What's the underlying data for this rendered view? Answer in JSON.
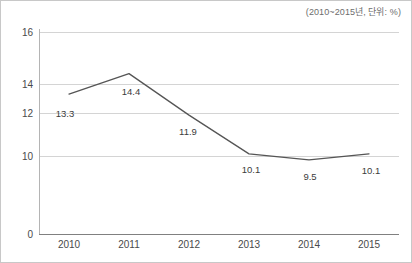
{
  "header": {
    "unit_note": "(2010~2015년, 단위: %)"
  },
  "chart_data": {
    "type": "line",
    "title": "",
    "subtitle": "(2010~2015년, 단위: %)",
    "xlabel": "",
    "ylabel": "",
    "categories": [
      "2010",
      "2011",
      "2012",
      "2013",
      "2014",
      "2015"
    ],
    "values": [
      13.3,
      14.4,
      11.9,
      10.1,
      9.5,
      10.1
    ],
    "value_labels": [
      "13.3",
      "14.4",
      "11.9",
      "10.1",
      "9.5",
      "10.1"
    ],
    "series": [
      {
        "name": "",
        "values": [
          13.3,
          14.4,
          11.9,
          10.1,
          9.5,
          10.1
        ],
        "color": "#555555"
      }
    ],
    "y_ticks": [
      16,
      14,
      12,
      10,
      0
    ],
    "y_tick_labels": [
      "16",
      "14",
      "12",
      "10",
      "0"
    ],
    "ylim": [
      0,
      16
    ],
    "axis_broken": true,
    "grid": true,
    "legend": false,
    "legend_position": "none",
    "line_color": "#555555",
    "grid_color": "#d4d4d4",
    "axis_color": "#808080",
    "text_color": "#4a4a4a",
    "background": "#ffffff",
    "markers": false
  },
  "axes": {
    "y_labels": [
      "16",
      "14",
      "12",
      "10",
      "0"
    ],
    "x_labels": [
      "2010",
      "2011",
      "2012",
      "2013",
      "2014",
      "2015"
    ]
  }
}
